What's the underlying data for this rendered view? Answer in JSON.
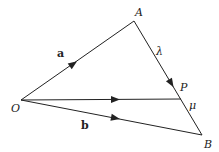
{
  "diagram": {
    "type": "vector-triangle",
    "points": {
      "O": {
        "label": "O",
        "x": 21,
        "y": 100
      },
      "A": {
        "label": "A",
        "x": 134,
        "y": 21
      },
      "B": {
        "label": "B",
        "x": 202,
        "y": 135
      },
      "P": {
        "label": "P",
        "x": 181,
        "y": 99
      }
    },
    "edges": [
      {
        "from": "O",
        "to": "A",
        "arrow": true,
        "label": "a"
      },
      {
        "from": "O",
        "to": "B",
        "arrow": true,
        "label": "b"
      },
      {
        "from": "O",
        "to": "P",
        "arrow": true,
        "label": ""
      },
      {
        "from": "A",
        "to": "P",
        "arrow": true,
        "label": "λ"
      },
      {
        "from": "P",
        "to": "B",
        "arrow": false,
        "label": "μ"
      }
    ],
    "labels": {
      "O": "O",
      "A": "A",
      "B": "B",
      "P": "P",
      "vec_a": "a",
      "vec_b": "b",
      "lambda": "λ",
      "mu": "μ"
    },
    "colors": {
      "line": "#222222",
      "background": "#ffffff"
    }
  }
}
